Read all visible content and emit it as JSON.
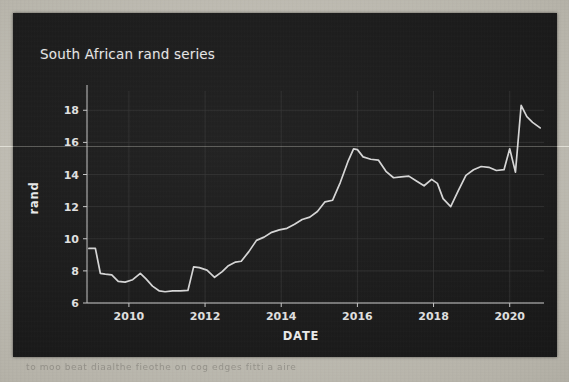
{
  "figure": {
    "title": "South African rand series",
    "background_color": "#1d1d1d",
    "line_color": "#d8d8d8",
    "text_color": "#e9e9e9",
    "grid_color": "#3a3a3a"
  },
  "page": {
    "background_color": "#bdbab1",
    "bleed_text": "to  moo  beat  diaalthe  fieothe  on  cog  edges  fitti  a  aire"
  },
  "chart_data": {
    "type": "line",
    "title": "South African rand series",
    "xlabel": "DATE",
    "ylabel": "rand",
    "grid": true,
    "legend": null,
    "xlim": [
      2008.9,
      2020.9
    ],
    "ylim": [
      6.0,
      19.2
    ],
    "xticks": [
      2010,
      2012,
      2014,
      2016,
      2018,
      2020
    ],
    "xtick_labels": [
      "2010",
      "2012",
      "2014",
      "2016",
      "2018",
      "2020"
    ],
    "yticks": [
      6,
      8,
      10,
      12,
      14,
      16,
      18
    ],
    "ytick_labels": [
      "6",
      "8",
      "10",
      "12",
      "14",
      "16",
      "18"
    ],
    "series": [
      {
        "name": "rand",
        "x": [
          2008.95,
          2009.12,
          2009.25,
          2009.38,
          2009.55,
          2009.72,
          2009.9,
          2010.1,
          2010.3,
          2010.45,
          2010.62,
          2010.8,
          2010.95,
          2011.15,
          2011.35,
          2011.55,
          2011.7,
          2011.85,
          2012.05,
          2012.25,
          2012.45,
          2012.6,
          2012.8,
          2012.95,
          2013.15,
          2013.35,
          2013.55,
          2013.75,
          2013.95,
          2014.15,
          2014.35,
          2014.55,
          2014.75,
          2014.95,
          2015.15,
          2015.35,
          2015.55,
          2015.75,
          2015.9,
          2016.0,
          2016.15,
          2016.35,
          2016.55,
          2016.75,
          2016.95,
          2017.15,
          2017.35,
          2017.55,
          2017.75,
          2017.95,
          2018.1,
          2018.25,
          2018.45,
          2018.65,
          2018.85,
          2019.05,
          2019.25,
          2019.45,
          2019.65,
          2019.85,
          2020.0,
          2020.15,
          2020.3,
          2020.45,
          2020.6,
          2020.8
        ],
        "y": [
          9.4,
          9.4,
          7.85,
          7.8,
          7.75,
          7.35,
          7.3,
          7.45,
          7.85,
          7.5,
          7.05,
          6.75,
          6.7,
          6.75,
          6.75,
          6.78,
          8.25,
          8.2,
          8.05,
          7.6,
          7.95,
          8.3,
          8.55,
          8.6,
          9.2,
          9.9,
          10.1,
          10.4,
          10.55,
          10.65,
          10.9,
          11.2,
          11.35,
          11.7,
          12.3,
          12.4,
          13.5,
          14.8,
          15.6,
          15.55,
          15.1,
          14.95,
          14.9,
          14.2,
          13.8,
          13.85,
          13.9,
          13.6,
          13.3,
          13.7,
          13.45,
          12.5,
          12.0,
          13.0,
          13.95,
          14.3,
          14.5,
          14.45,
          14.25,
          14.3,
          15.6,
          14.15,
          18.3,
          17.6,
          17.25,
          16.9
        ]
      }
    ]
  }
}
